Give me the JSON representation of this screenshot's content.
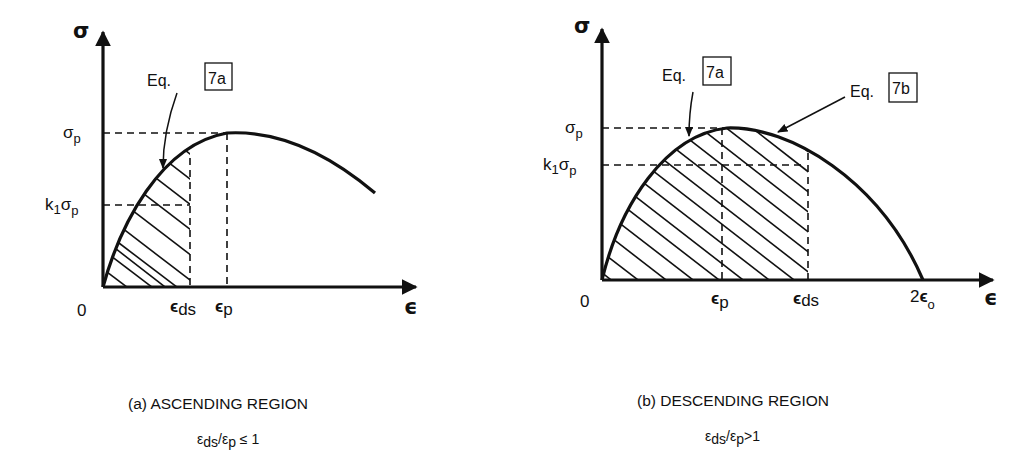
{
  "panel_a": {
    "y_axis_label": "σ",
    "x_axis_label": "ϵ",
    "origin_label": "0",
    "sigma_p": {
      "main": "σ",
      "sub": "p"
    },
    "k1_sigma_p": {
      "k": "k",
      "k_sub": "1",
      "main": "σ",
      "sub": "p"
    },
    "eps_ds": {
      "main": "ϵ",
      "sub": "ds"
    },
    "eps_p": {
      "main": "ϵ",
      "sub": "p"
    },
    "eq_7a": {
      "text": "Eq.",
      "ref": "7a"
    },
    "caption": "(a)  ASCENDING REGION",
    "condition": {
      "e1": "ε",
      "s1": "ds",
      "slash": "/",
      "e2": "ε",
      "s2": "p",
      "rel": " ≤ 1"
    }
  },
  "panel_b": {
    "y_axis_label": "σ",
    "x_axis_label": "ϵ",
    "origin_label": "0",
    "sigma_p": {
      "main": "σ",
      "sub": "p"
    },
    "k1_sigma_p": {
      "k": "k",
      "k_sub": "1",
      "main": "σ",
      "sub": "p"
    },
    "eps_p": {
      "main": "ϵ",
      "sub": "p"
    },
    "eps_ds": {
      "main": "ϵ",
      "sub": "ds"
    },
    "two_eps_o": {
      "coef": "2",
      "main": "ϵ",
      "sub": "o"
    },
    "eq_7a": {
      "text": "Eq.",
      "ref": "7a"
    },
    "eq_7b": {
      "text": "Eq.",
      "ref": "7b"
    },
    "caption": "(b) DESCENDING REGION",
    "condition": {
      "e1": "ε",
      "s1": "ds",
      "slash": "/",
      "e2": "ε",
      "s2": "p",
      "rel": ">1"
    }
  }
}
